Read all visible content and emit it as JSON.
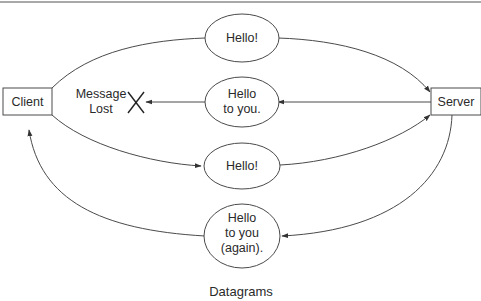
{
  "diagram": {
    "caption": "Datagrams",
    "nodes": {
      "client": {
        "label": "Client"
      },
      "server": {
        "label": "Server"
      }
    },
    "messages": [
      {
        "id": "msg1",
        "lines": [
          "Hello!"
        ],
        "direction": "client-to-server",
        "delivered": true
      },
      {
        "id": "msg2",
        "lines": [
          "Hello",
          "to you."
        ],
        "direction": "server-to-client",
        "delivered": false
      },
      {
        "id": "msg3",
        "lines": [
          "Hello!"
        ],
        "direction": "client-to-server",
        "delivered": true
      },
      {
        "id": "msg4",
        "lines": [
          "Hello",
          "to you",
          "(again)."
        ],
        "direction": "server-to-client",
        "delivered": true
      }
    ],
    "lost_marker": {
      "lines": [
        "Message",
        "Lost"
      ],
      "symbol": "X"
    }
  }
}
